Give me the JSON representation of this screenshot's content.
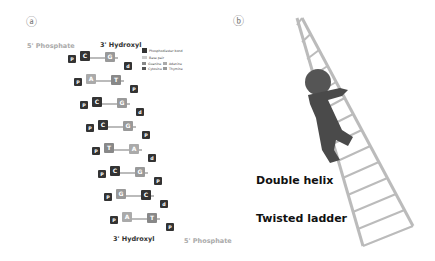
{
  "panel_a": {
    "label": "ⓐ",
    "top_left": "5' Phosphate",
    "top_right": "3' Hydroxyl",
    "bottom_left": "3' Hydroxyl",
    "bottom_right": "5' Phosphate",
    "legend": [
      "Phosphodiester bond",
      "Base pair",
      "Guanine",
      "Cytosine",
      "Adenine",
      "Thymine"
    ],
    "pairs": [
      [
        "C",
        "G"
      ],
      [
        "A",
        "T"
      ],
      [
        "C",
        "G"
      ],
      [
        "C",
        "G"
      ],
      [
        "T",
        "A"
      ],
      [
        "C",
        "G"
      ],
      [
        "G",
        "C"
      ],
      [
        "A",
        "T"
      ]
    ]
  },
  "panel_b": {
    "label": "ⓑ",
    "caption1": "Double helix",
    "caption2": "Twisted ladder"
  }
}
